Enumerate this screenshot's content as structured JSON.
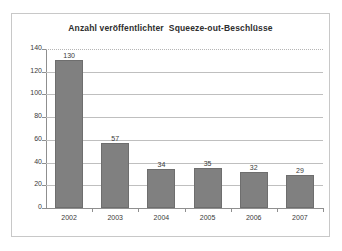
{
  "chart_data": {
    "type": "bar",
    "title": "Anzahl veröffentlichter  Squeeze-out-Beschlüsse",
    "xlabel": "",
    "ylabel": "",
    "categories": [
      "2002",
      "2003",
      "2004",
      "2005",
      "2006",
      "2007"
    ],
    "values": [
      130,
      57,
      34,
      35,
      32,
      29
    ],
    "value_labels": [
      "130",
      "57",
      "34",
      "35",
      "32",
      "29"
    ],
    "ylim": [
      0,
      140
    ],
    "ytick_values": [
      0,
      20,
      40,
      60,
      80,
      100,
      120,
      140
    ],
    "ytick_labels": [
      "0",
      "20",
      "40",
      "60",
      "80",
      "100",
      "120",
      "140"
    ],
    "grid": "horizontal",
    "legend": "none",
    "series": [
      {
        "name": "Squeeze-out-Beschlüsse",
        "values": [
          130,
          57,
          34,
          35,
          32,
          29
        ],
        "color": "#808080"
      }
    ],
    "colors": {
      "bar_fill": "#808080",
      "bar_border": "#6e6e6e",
      "gridline": "#bfbfbf",
      "axis": "#8f8f8f",
      "frame": "#c8c8c8",
      "background": "#ffffff",
      "text": "#3a3a3a"
    }
  }
}
